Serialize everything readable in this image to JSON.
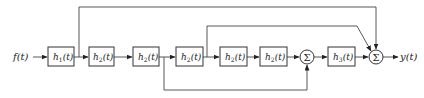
{
  "diagram": {
    "type": "block-diagram",
    "input": {
      "label": "f(t)"
    },
    "output": {
      "label": "y(t)"
    },
    "blocks": [
      {
        "id": "b1",
        "base": "h",
        "sub": "1",
        "arg": "(t)",
        "x": 48,
        "y": 47,
        "w": 26,
        "h": 19
      },
      {
        "id": "b2",
        "base": "h",
        "sub": "2",
        "arg": "(t)",
        "x": 89,
        "y": 47,
        "w": 25,
        "h": 19
      },
      {
        "id": "b3",
        "base": "h",
        "sub": "2",
        "arg": "(t)",
        "x": 133,
        "y": 47,
        "w": 26,
        "h": 19
      },
      {
        "id": "b4",
        "base": "h",
        "sub": "2",
        "arg": "(t)",
        "x": 176,
        "y": 47,
        "w": 27,
        "h": 19
      },
      {
        "id": "b5",
        "base": "h",
        "sub": "2",
        "arg": "(t)",
        "x": 220,
        "y": 47,
        "w": 27,
        "h": 19
      },
      {
        "id": "b6",
        "base": "h",
        "sub": "2",
        "arg": "(t)",
        "x": 260,
        "y": 47,
        "w": 27,
        "h": 19
      },
      {
        "id": "b7",
        "base": "h",
        "sub": "3",
        "arg": "(t)",
        "x": 328,
        "y": 47,
        "w": 27,
        "h": 19
      }
    ],
    "summers": [
      {
        "id": "s1",
        "symbol": "Σ",
        "cx": 307,
        "cy": 57,
        "r": 7
      },
      {
        "id": "s2",
        "symbol": "Σ",
        "cx": 376,
        "cy": 57,
        "r": 7
      }
    ],
    "connections": [
      "f(t) → h1(t)",
      "h1(t) → h2(t)",
      "h2(t) → h2(t)",
      "h2(t) → h2(t)",
      "h2(t) → h2(t)",
      "h2(t) → h2(t)",
      "h2(t) → Σ1",
      "Σ1 → h3(t)",
      "h3(t) → Σ2",
      "Σ2 → y(t)",
      "h1(t) output → Σ2 (top feedforward)",
      "3rd block output → Σ2 (upper feedforward, diagonal)",
      "2nd h2 output → Σ1 (bottom feedforward)"
    ]
  }
}
